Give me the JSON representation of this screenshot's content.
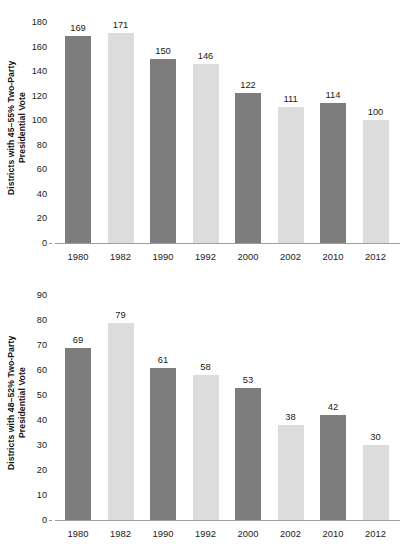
{
  "chart_data": [
    {
      "id": "top",
      "type": "bar",
      "title": "",
      "xlabel": "",
      "ylabel": "Districts with 45–55% Two-Party\nPresidential Vote",
      "categories": [
        "1980",
        "1982",
        "1990",
        "1992",
        "2000",
        "2002",
        "2010",
        "2012"
      ],
      "values": [
        169,
        171,
        150,
        146,
        122,
        111,
        114,
        100
      ],
      "bar_shades": [
        "dark",
        "light",
        "dark",
        "light",
        "dark",
        "light",
        "dark",
        "light"
      ],
      "data_labels": [
        "169",
        "171",
        "150",
        "146",
        "122",
        "111",
        "114",
        "100"
      ],
      "ylim": [
        0,
        180
      ],
      "ytick_step": 20,
      "yticks": [
        "0",
        "20",
        "40",
        "60",
        "80",
        "100",
        "120",
        "140",
        "160",
        "180"
      ],
      "grid": false,
      "legend": "none"
    },
    {
      "id": "bottom",
      "type": "bar",
      "title": "",
      "xlabel": "",
      "ylabel": "Districts with 48–52% Two-Party\nPresidential Vote",
      "categories": [
        "1980",
        "1982",
        "1990",
        "1992",
        "2000",
        "2002",
        "2010",
        "2012"
      ],
      "values": [
        69,
        79,
        61,
        58,
        53,
        38,
        42,
        30
      ],
      "bar_shades": [
        "dark",
        "light",
        "dark",
        "light",
        "dark",
        "light",
        "dark",
        "light"
      ],
      "data_labels": [
        "69",
        "79",
        "61",
        "58",
        "53",
        "38",
        "42",
        "30"
      ],
      "ylim": [
        0,
        90
      ],
      "ytick_step": 10,
      "yticks": [
        "0",
        "10",
        "20",
        "30",
        "40",
        "50",
        "60",
        "70",
        "80",
        "90"
      ],
      "grid": false,
      "legend": "none"
    }
  ],
  "colors": {
    "bar_dark": "#7d7d7d",
    "bar_light": "#dcdcdc",
    "axis": "#9e9e9e",
    "text": "#1a1a1a",
    "background": "#ffffff"
  }
}
